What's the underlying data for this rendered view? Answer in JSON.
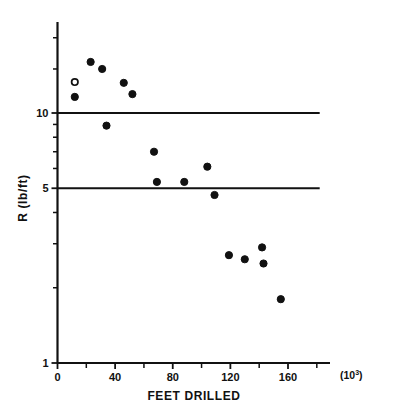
{
  "chart_data": {
    "type": "scatter",
    "title": "",
    "xlabel": "FEET DRILLED",
    "ylabel": "R (lb/ft)",
    "x_multiplier_label": "(10",
    "x_multiplier_exp": "3",
    "x_multiplier_close": ")",
    "xlim": [
      0,
      182
    ],
    "ylim": [
      1,
      21
    ],
    "yscale": "log",
    "xscale": "linear",
    "grid": false,
    "legend": null,
    "x_ticks": [
      0,
      40,
      80,
      120,
      160
    ],
    "x_tick_labels": [
      "0",
      "40",
      "80",
      "120",
      "160"
    ],
    "x_minor_ticks": [
      20,
      60,
      100,
      140,
      180
    ],
    "y_ticks": [
      1,
      5,
      10
    ],
    "y_tick_labels": [
      "1",
      "5",
      "10"
    ],
    "y_minor_ticks": [
      2,
      3,
      4,
      6,
      7,
      8,
      9,
      15,
      20
    ],
    "reference_lines": [
      {
        "y": 10,
        "x_start": 0,
        "x_end": 182
      },
      {
        "y": 5,
        "x_start": 0,
        "x_end": 182
      }
    ],
    "series": [
      {
        "name": "observations",
        "marker": "filled-circle",
        "points": [
          {
            "x": 12,
            "y": 11.6
          },
          {
            "x": 23,
            "y": 16.0
          },
          {
            "x": 31,
            "y": 15.0
          },
          {
            "x": 34,
            "y": 8.9
          },
          {
            "x": 46,
            "y": 13.2
          },
          {
            "x": 52,
            "y": 11.9
          },
          {
            "x": 67,
            "y": 7.0
          },
          {
            "x": 69,
            "y": 5.3
          },
          {
            "x": 88,
            "y": 5.3
          },
          {
            "x": 104,
            "y": 6.1
          },
          {
            "x": 109,
            "y": 4.7
          },
          {
            "x": 119,
            "y": 2.7
          },
          {
            "x": 130,
            "y": 2.6
          },
          {
            "x": 142,
            "y": 2.9
          },
          {
            "x": 143,
            "y": 2.5
          },
          {
            "x": 155,
            "y": 1.8
          }
        ]
      },
      {
        "name": "outlier",
        "marker": "open-circle",
        "points": [
          {
            "x": 12,
            "y": 13.3
          }
        ]
      }
    ]
  },
  "caption": {
    "text": ""
  }
}
